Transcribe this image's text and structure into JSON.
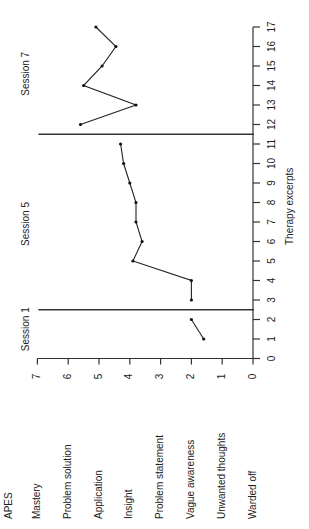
{
  "chart_data": {
    "type": "line",
    "orientation": "rotated 90 degrees counter-clockwise (x-axis runs vertically on right, y-axis runs horizontally along the bottom)",
    "title": "",
    "xlabel": "Therapy excerpts",
    "ylabel": "APES",
    "xlim": [
      0,
      17
    ],
    "ylim": [
      0,
      7
    ],
    "x_ticks": [
      "0",
      "1",
      "2",
      "3",
      "4",
      "5",
      "6",
      "7",
      "8",
      "9",
      "10",
      "11",
      "12",
      "13",
      "14",
      "15",
      "16",
      "17"
    ],
    "y_ticks": [
      "0",
      "1",
      "2",
      "3",
      "4",
      "5",
      "6",
      "7"
    ],
    "y_category_labels": [
      {
        "value": 7,
        "label": "Mastery"
      },
      {
        "value": 6,
        "label": "Problem solution"
      },
      {
        "value": 5,
        "label": "Application"
      },
      {
        "value": 4,
        "label": "Insight"
      },
      {
        "value": 3,
        "label": "Problem statement"
      },
      {
        "value": 2,
        "label": "Vague awareness"
      },
      {
        "value": 1,
        "label": "Unwanted thoughts"
      },
      {
        "value": 0,
        "label": "Warded off"
      }
    ],
    "grid": false,
    "session_dividers": [
      2.5,
      11.5
    ],
    "annotations": [
      "Session 1",
      "Session 5",
      "Session 7"
    ],
    "series": [
      {
        "name": "Session 1",
        "x": [
          1,
          2
        ],
        "values": [
          1.6,
          2.0
        ]
      },
      {
        "name": "Session 5",
        "x": [
          3,
          4,
          5,
          6,
          7,
          8,
          9,
          10,
          11
        ],
        "values": [
          2.0,
          2.0,
          3.9,
          3.6,
          3.8,
          3.8,
          4.0,
          4.2,
          4.3
        ]
      },
      {
        "name": "Session 7",
        "x": [
          12,
          13,
          14,
          15,
          16,
          17
        ],
        "values": [
          5.6,
          3.8,
          5.5,
          4.9,
          4.45,
          5.1
        ]
      }
    ]
  },
  "labels": {
    "apes": "APES",
    "xlabel": "Therapy excerpts",
    "sessions": [
      "Session 1",
      "Session 5",
      "Session 7"
    ],
    "categories": [
      "Mastery",
      "Problem solution",
      "Application",
      "Insight",
      "Problem statement",
      "Vague awareness",
      "Unwanted thoughts",
      "Warded off"
    ]
  }
}
